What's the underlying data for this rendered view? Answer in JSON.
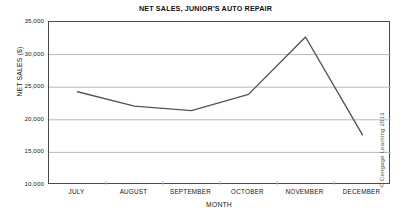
{
  "chart_data": {
    "type": "line",
    "title": "NET SALES, JUNIOR'S AUTO REPAIR",
    "xlabel": "MONTH",
    "ylabel": "NET SALES ($)",
    "categories": [
      "JULY",
      "AUGUST",
      "SEPTEMBER",
      "OCTOBER",
      "NOVEMBER",
      "DECEMBER"
    ],
    "values": [
      24300,
      22100,
      21400,
      23900,
      32700,
      17700
    ],
    "series": [
      {
        "name": "Net Sales",
        "values": [
          24300,
          22100,
          21400,
          23900,
          32700,
          17700
        ]
      }
    ],
    "ylim": [
      10000,
      35000
    ],
    "yticks": [
      35000,
      30000,
      25000,
      20000,
      15000,
      10000
    ],
    "ytick_labels": [
      "35,000",
      "30,000",
      "25,000",
      "20,000",
      "15,000",
      "10,000"
    ],
    "grid": true,
    "grid_axis": "y",
    "legend": false,
    "legend_position": "none",
    "line_color": "#555555",
    "grid_color": "#b8b8b8",
    "axis_color": "#4a4a4a",
    "background_color": "#ffffff"
  },
  "credit": {
    "text": "© Cengage Learning 2013"
  }
}
